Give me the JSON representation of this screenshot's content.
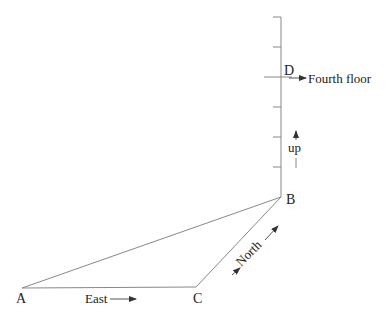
{
  "diagram": {
    "points": {
      "A": {
        "label": "A"
      },
      "B": {
        "label": "B"
      },
      "C": {
        "label": "C"
      },
      "D": {
        "label": "D"
      }
    },
    "annotations": {
      "east": "East",
      "north": "North",
      "up": "up",
      "fourth_floor": "Fourth floor"
    },
    "vertical_scale": {
      "tick_count": 6
    },
    "colors": {
      "line": "#888888",
      "text": "#222222",
      "background": "#ffffff"
    }
  }
}
